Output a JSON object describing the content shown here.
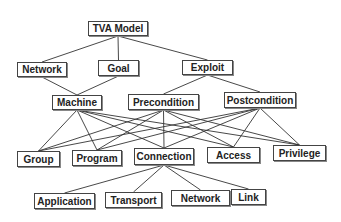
{
  "diagram": {
    "title": "TVA Model",
    "nodes": [
      {
        "id": "tva",
        "label": "TVA Model",
        "x": 88,
        "y": 21,
        "w": 60,
        "h": 15
      },
      {
        "id": "network",
        "label": "Network",
        "x": 17,
        "y": 62,
        "w": 50,
        "h": 15
      },
      {
        "id": "goal",
        "label": "Goal",
        "x": 98,
        "y": 60,
        "w": 41,
        "h": 16
      },
      {
        "id": "exploit",
        "label": "Exploit",
        "x": 182,
        "y": 60,
        "w": 51,
        "h": 15
      },
      {
        "id": "machine",
        "label": "Machine",
        "x": 52,
        "y": 95,
        "w": 50,
        "h": 15
      },
      {
        "id": "precondition",
        "label": "Precondition",
        "x": 128,
        "y": 94,
        "w": 71,
        "h": 16
      },
      {
        "id": "postcondition",
        "label": "Postcondition",
        "x": 224,
        "y": 92,
        "w": 72,
        "h": 16
      },
      {
        "id": "group",
        "label": "Group",
        "x": 17,
        "y": 151,
        "w": 43,
        "h": 16
      },
      {
        "id": "program",
        "label": "Program",
        "x": 72,
        "y": 150,
        "w": 50,
        "h": 16
      },
      {
        "id": "connection",
        "label": "Connection",
        "x": 134,
        "y": 148,
        "w": 60,
        "h": 17
      },
      {
        "id": "access",
        "label": "Access",
        "x": 207,
        "y": 147,
        "w": 53,
        "h": 16
      },
      {
        "id": "privilege",
        "label": "Privilege",
        "x": 273,
        "y": 145,
        "w": 53,
        "h": 16
      },
      {
        "id": "application",
        "label": "Application",
        "x": 34,
        "y": 193,
        "w": 61,
        "h": 16
      },
      {
        "id": "transport",
        "label": "Transport",
        "x": 105,
        "y": 192,
        "w": 57,
        "h": 16
      },
      {
        "id": "network2",
        "label": "Network",
        "x": 171,
        "y": 190,
        "w": 59,
        "h": 16
      },
      {
        "id": "link",
        "label": "Link",
        "x": 231,
        "y": 189,
        "w": 35,
        "h": 16
      }
    ],
    "edges": [
      [
        "tva",
        "network"
      ],
      [
        "tva",
        "goal"
      ],
      [
        "tva",
        "exploit"
      ],
      [
        "network",
        "machine"
      ],
      [
        "goal",
        "machine"
      ],
      [
        "exploit",
        "precondition"
      ],
      [
        "exploit",
        "postcondition"
      ],
      [
        "machine",
        "group"
      ],
      [
        "machine",
        "program"
      ],
      [
        "machine",
        "connection"
      ],
      [
        "machine",
        "access"
      ],
      [
        "machine",
        "privilege"
      ],
      [
        "precondition",
        "group"
      ],
      [
        "precondition",
        "program"
      ],
      [
        "precondition",
        "connection"
      ],
      [
        "precondition",
        "access"
      ],
      [
        "precondition",
        "privilege"
      ],
      [
        "postcondition",
        "group"
      ],
      [
        "postcondition",
        "program"
      ],
      [
        "postcondition",
        "connection"
      ],
      [
        "postcondition",
        "access"
      ],
      [
        "postcondition",
        "privilege"
      ],
      [
        "connection",
        "application"
      ],
      [
        "connection",
        "transport"
      ],
      [
        "connection",
        "network2"
      ],
      [
        "connection",
        "link"
      ]
    ],
    "colors": {
      "line": "#333333",
      "border": "#444444",
      "text": "#222222",
      "background": "#ffffff"
    }
  }
}
